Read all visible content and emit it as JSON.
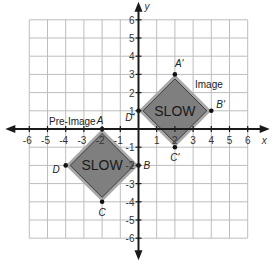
{
  "graph": {
    "xmin": -6,
    "xmax": 6,
    "ymin": -6,
    "ymax": 6,
    "x_axis_label": "x",
    "y_axis_label": "y",
    "x_ticks": [
      "-6",
      "-5",
      "-4",
      "-3",
      "-2",
      "-1",
      "1",
      "2",
      "3",
      "4",
      "5",
      "6"
    ],
    "y_ticks": [
      "-6",
      "-5",
      "-4",
      "-3",
      "-2",
      "-1",
      "1",
      "2",
      "3",
      "4",
      "5",
      "6"
    ],
    "grid_color": "#bdbdbd",
    "axis_color": "#1a1a1a"
  },
  "pre_image": {
    "label": "Pre-Image",
    "sign_text": "SLOW",
    "fill": "#7f7f7f",
    "border": "#a8a8a8",
    "vertices": [
      {
        "name": "A",
        "x": -2,
        "y": 0
      },
      {
        "name": "B",
        "x": 0,
        "y": -2
      },
      {
        "name": "C",
        "x": -2,
        "y": -4
      },
      {
        "name": "D",
        "x": -4,
        "y": -2
      }
    ]
  },
  "image": {
    "label": "Image",
    "sign_text": "SLOW",
    "fill": "#7f7f7f",
    "border": "#a8a8a8",
    "vertices": [
      {
        "name": "A'",
        "x": 2,
        "y": 3
      },
      {
        "name": "B'",
        "x": 4,
        "y": 1
      },
      {
        "name": "C'",
        "x": 2,
        "y": -1
      },
      {
        "name": "D'",
        "x": 0,
        "y": 1
      }
    ]
  }
}
